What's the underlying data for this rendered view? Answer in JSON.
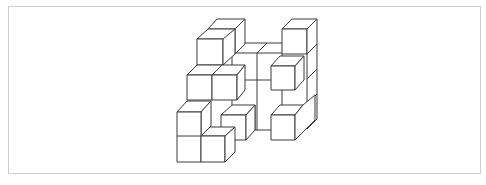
{
  "figure": {
    "type": "isometric-cube-structure",
    "stroke_color": "#3a3a3a",
    "background": "#ffffff",
    "frame_border_color": "#cfcfcf",
    "cube_edge_px": 25,
    "depth_offset_px": [
      10,
      -10
    ]
  }
}
